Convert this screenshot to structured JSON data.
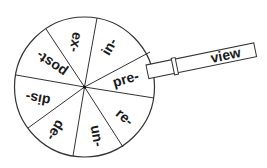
{
  "wheel": {
    "segments": [
      {
        "label": "in-"
      },
      {
        "label": "pre-"
      },
      {
        "label": "re-"
      },
      {
        "label": "un-"
      },
      {
        "label": "de-"
      },
      {
        "label": "dis-"
      },
      {
        "label": "post-"
      },
      {
        "label": "ex-"
      }
    ]
  },
  "tab": {
    "label": "view"
  },
  "colors": {
    "line": "#333333",
    "text": "#1a1a1a",
    "background": "#ffffff"
  }
}
